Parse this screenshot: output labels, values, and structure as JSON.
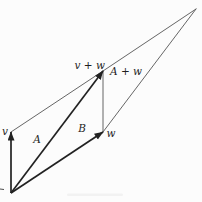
{
  "figure": {
    "background_color": "#fcfcfc",
    "stroke_bold_color": "#222222",
    "stroke_thin_color": "#555555",
    "label_color": "#1f1f1f",
    "points": {
      "origin": {
        "x": 11,
        "y": 193
      },
      "v_tip": {
        "x": 11,
        "y": 132
      },
      "w_tip": {
        "x": 103,
        "y": 132
      },
      "v_plus_w_tip": {
        "x": 103,
        "y": 71
      },
      "far_vertex": {
        "x": 196,
        "y": 9
      }
    },
    "bold_arrows": [
      {
        "name": "vector-v-arrow",
        "from": "origin",
        "to": "v_tip"
      },
      {
        "name": "vector-v-plus-w-arrow",
        "from": "origin",
        "to": "v_plus_w_tip"
      },
      {
        "name": "vector-w-arrow",
        "from": "origin",
        "to": "w_tip"
      }
    ],
    "thin_lines": [
      {
        "name": "segment-vtip-to-vplusw",
        "from": "v_tip",
        "to": "v_plus_w_tip"
      },
      {
        "name": "segment-vplusw-to-wtip",
        "from": "v_plus_w_tip",
        "to": "w_tip"
      },
      {
        "name": "segment-vplusw-to-farvertex",
        "from": "v_plus_w_tip",
        "to": "far_vertex"
      },
      {
        "name": "segment-wtip-to-farvertex",
        "from": "w_tip",
        "to": "far_vertex"
      }
    ],
    "labels": [
      {
        "name": "label-v",
        "text": "v",
        "x": 5,
        "y": 135,
        "anchor": "middle"
      },
      {
        "name": "label-v-plus-w",
        "text": "v + w",
        "x": 105,
        "y": 68.5,
        "anchor": "end"
      },
      {
        "name": "label-a-plus-w",
        "text": "A + w",
        "x": 126,
        "y": 75,
        "anchor": "middle"
      },
      {
        "name": "label-a",
        "text": "A",
        "x": 37,
        "y": 143,
        "anchor": "middle"
      },
      {
        "name": "label-b",
        "text": "B",
        "x": 82,
        "y": 132,
        "anchor": "middle"
      },
      {
        "name": "label-w",
        "text": "w",
        "x": 106.5,
        "y": 136.5,
        "anchor": "start"
      }
    ],
    "artifacts": [
      {
        "name": "left-edge-tick",
        "type": "line",
        "x1": 0,
        "y1": 189,
        "x2": 4,
        "y2": 189.5,
        "opacity": 0.8
      },
      {
        "name": "bottom-smudge",
        "type": "rect",
        "x": 67,
        "y": 193.5,
        "w": 56,
        "h": 2.5,
        "opacity": 0.04
      }
    ]
  }
}
